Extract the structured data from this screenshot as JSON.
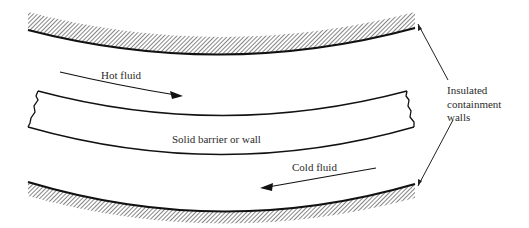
{
  "figure": {
    "labels": {
      "hot_fluid": "Hot fluid",
      "cold_fluid": "Cold fluid",
      "barrier": "Solid barrier or wall",
      "walls_line1": "Insulated",
      "walls_line2": "containment",
      "walls_line3": "walls"
    },
    "colors": {
      "line": "#111111",
      "hatch": "#555555",
      "text": "#2b2b2b",
      "background": "#ffffff"
    }
  }
}
